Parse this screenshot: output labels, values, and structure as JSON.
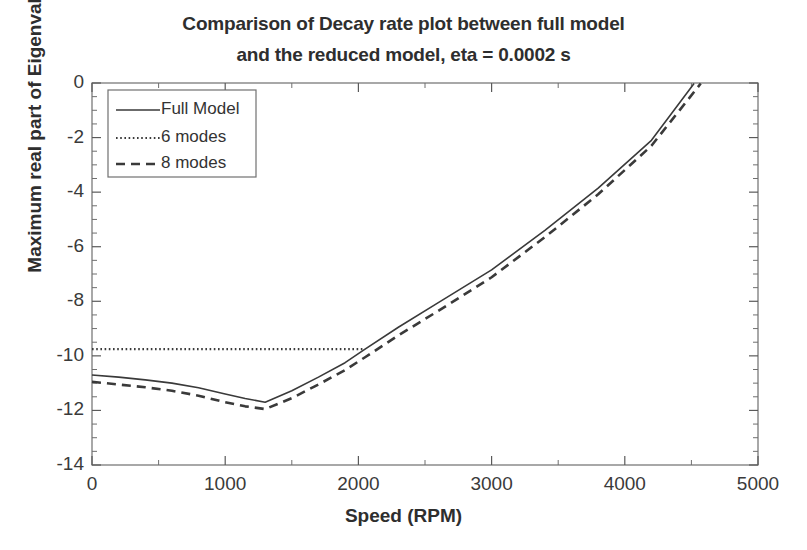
{
  "chart_data": {
    "type": "line",
    "title": "Comparison of Decay rate plot between full model and the reduced model, eta = 0.0002 s",
    "title_lines": [
      "Comparison of Decay rate plot between full model",
      "and the reduced model, eta = 0.0002 s"
    ],
    "xlabel": "Speed (RPM)",
    "ylabel": "Maximum real part of Eigenvalues",
    "xlim": [
      0,
      5000
    ],
    "ylim": [
      -14,
      0
    ],
    "xticks": [
      0,
      1000,
      2000,
      3000,
      4000,
      5000
    ],
    "xtick_labels": [
      "0",
      "1000",
      "2000",
      "3000",
      "4000",
      "5000"
    ],
    "yticks": [
      0,
      -2,
      -4,
      -6,
      -8,
      -10,
      -12,
      -14
    ],
    "ytick_labels": [
      "0",
      "-2",
      "-4",
      "-6",
      "-8",
      "-10",
      "-12",
      "-14"
    ],
    "x_minor_tick_step": 500,
    "y_minor_tick_step": 0.5,
    "grid": false,
    "legend_position": "upper left",
    "line_color": "#3a3a3a",
    "axes_color": "#6b6b6b",
    "series": [
      {
        "name": "Full Model",
        "style": "solid",
        "x": [
          0,
          200,
          400,
          600,
          800,
          1000,
          1150,
          1300,
          1500,
          1700,
          1900,
          2050,
          2300,
          2600,
          3000,
          3400,
          3800,
          4200,
          4520
        ],
        "y": [
          -10.7,
          -10.78,
          -10.88,
          -11.0,
          -11.17,
          -11.4,
          -11.56,
          -11.7,
          -11.28,
          -10.78,
          -10.25,
          -9.75,
          -8.95,
          -8.05,
          -6.85,
          -5.4,
          -3.85,
          -2.1,
          -0.02
        ]
      },
      {
        "name": "6 modes",
        "style": "dotted",
        "x": [
          0,
          300,
          600,
          900,
          1200,
          1500,
          1800,
          2050
        ],
        "y": [
          -9.75,
          -9.75,
          -9.75,
          -9.75,
          -9.75,
          -9.75,
          -9.75,
          -9.75
        ]
      },
      {
        "name": "8 modes",
        "style": "dashed",
        "x": [
          0,
          200,
          400,
          600,
          800,
          1000,
          1150,
          1300,
          1500,
          1700,
          1900,
          2050,
          2300,
          2600,
          3000,
          3400,
          3800,
          4200,
          4570
        ],
        "y": [
          -10.95,
          -11.05,
          -11.15,
          -11.28,
          -11.46,
          -11.7,
          -11.85,
          -11.95,
          -11.55,
          -11.05,
          -10.52,
          -10.05,
          -9.25,
          -8.35,
          -7.12,
          -5.65,
          -4.08,
          -2.3,
          -0.02
        ]
      }
    ],
    "legend_entries": [
      {
        "label": "Full Model",
        "style": "solid"
      },
      {
        "label": "6 modes",
        "style": "dotted"
      },
      {
        "label": "8 modes",
        "style": "dashed"
      }
    ],
    "annotations": {
      "minimum_note": "Full Model and 8 modes reach minimum near 1300 RPM",
      "crossing_note": "6 modes constant line intersects rising curves near 2050 RPM"
    }
  }
}
